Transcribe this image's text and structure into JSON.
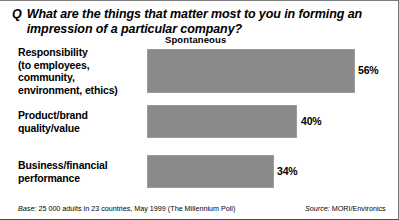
{
  "question": {
    "marker": "Q",
    "text": "What are the things that matter most to you in forming an impression of a particular company?"
  },
  "column_header": "Spontaneous",
  "footnotes": {
    "base_label": "Base:",
    "base_text": " 25 000 adults in 23 countries, May 1999 (The Millennium Poll)",
    "source_label": "Source:",
    "source_text": " MORI/Environics"
  },
  "colors": {
    "bar_fill": "#8a8a8a",
    "bar_border": "#9b9b9b",
    "text": "#000000",
    "background": "#ffffff"
  },
  "chart_data": {
    "type": "bar",
    "orientation": "horizontal",
    "title": "What are the things that matter most to you in forming an impression of a particular company?",
    "series_name": "Spontaneous",
    "xlabel": "",
    "ylabel": "",
    "xlim": [
      0,
      100
    ],
    "grid": false,
    "legend": "none",
    "unit": "%",
    "categories": [
      "Responsibility (to employees, community, environment, ethics)",
      "Product/brand quality/value",
      "Business/financial performance"
    ],
    "values": [
      56,
      40,
      34
    ],
    "value_labels": [
      "56%",
      "40%",
      "34%"
    ],
    "category_label_lines": [
      [
        "Responsibility",
        "(to employees,",
        "community,",
        "environment, ethics)"
      ],
      [
        "Product/brand",
        "quality/value"
      ],
      [
        "Business/financial",
        "performance"
      ]
    ]
  }
}
